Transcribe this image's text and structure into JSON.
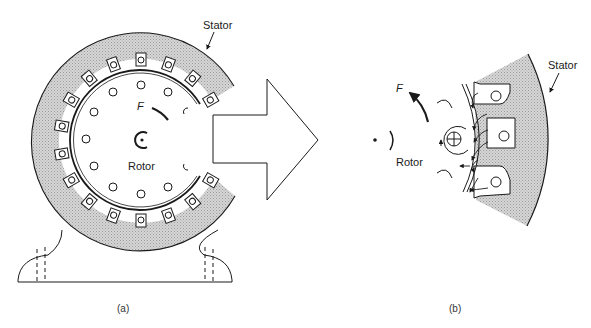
{
  "figure": {
    "panels": [
      {
        "id": "a",
        "caption": "(a)",
        "labels": {
          "stator": "Stator",
          "rotor": "Rotor",
          "force": "F"
        }
      },
      {
        "id": "b",
        "caption": "(b)",
        "labels": {
          "stator": "Stator",
          "rotor": "Rotor",
          "force": "F"
        }
      }
    ],
    "colors": {
      "line": "#1a1a1a",
      "stator_fill": "#c8c8c8",
      "background": "#ffffff"
    }
  }
}
